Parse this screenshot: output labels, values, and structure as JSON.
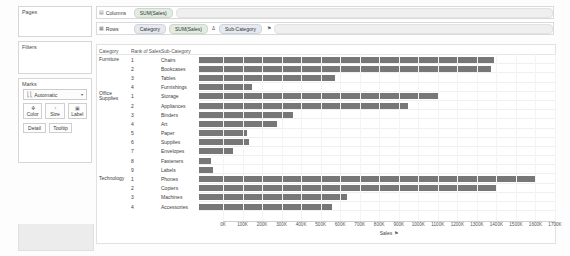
{
  "left_panel": {
    "pages": {
      "title": "Pages"
    },
    "filters": {
      "title": "Filters"
    },
    "marks": {
      "title": "Marks",
      "type_icon": "bar-chart-icon",
      "type_label": "Automatic",
      "caret": "▾",
      "buttons": [
        {
          "name": "color",
          "label": "Color",
          "icon": "❖"
        },
        {
          "name": "size",
          "label": "Size",
          "icon": "◔"
        },
        {
          "name": "label",
          "label": "Label",
          "icon": "▣"
        },
        {
          "name": "detail",
          "label": "Detail",
          "icon": ""
        },
        {
          "name": "tooltip",
          "label": "Tooltip",
          "icon": ""
        }
      ]
    }
  },
  "shelves": {
    "columns": {
      "icon": "⦀",
      "label": "Columns",
      "pills": [
        {
          "text": "SUM(Sales)",
          "type": "green"
        }
      ]
    },
    "rows": {
      "icon": "≡",
      "label": "Rows",
      "pills": [
        {
          "text": "Category",
          "type": "blue"
        },
        {
          "text": "SUM(Sales)",
          "type": "green"
        },
        {
          "text": "Δ",
          "type": "sym"
        },
        {
          "text": "Sub-Category",
          "type": "blue",
          "sort_icon": "⚑"
        }
      ]
    }
  },
  "viz": {
    "headers": {
      "category": "Category",
      "rank": "Rank of Sales",
      "subcategory": "Sub-Category"
    },
    "axis_title": "Sales",
    "axis_sort_icon": "⚑"
  },
  "chart_data": {
    "type": "bar",
    "title": "",
    "xlabel": "Sales",
    "ylabel": "",
    "xlim": [
      0,
      1700000
    ],
    "grid": true,
    "legend": "none",
    "orientation": "horizontal",
    "bar_color": "#777777",
    "tick_labels": [
      "0K",
      "100K",
      "200K",
      "300K",
      "400K",
      "500K",
      "600K",
      "700K",
      "800K",
      "900K",
      "1000K",
      "1100K",
      "1200K",
      "1300K",
      "1400K",
      "1500K",
      "1600K",
      "1700K"
    ],
    "tick_values": [
      0,
      100000,
      200000,
      300000,
      400000,
      500000,
      600000,
      700000,
      800000,
      900000,
      1000000,
      1100000,
      1200000,
      1300000,
      1400000,
      1500000,
      1600000,
      1700000
    ],
    "rows": [
      {
        "category": "Furniture",
        "category_line2": "",
        "rank": "1",
        "subcategory": "Chairs",
        "value": 1407000
      },
      {
        "category": "",
        "category_line2": "",
        "rank": "2",
        "subcategory": "Bookcases",
        "value": 1392000
      },
      {
        "category": "",
        "category_line2": "",
        "rank": "3",
        "subcategory": "Tables",
        "value": 650000
      },
      {
        "category": "",
        "category_line2": "",
        "rank": "4",
        "subcategory": "Furnishings",
        "value": 253000
      },
      {
        "category": "Office",
        "category_line2": "Supplies",
        "rank": "1",
        "subcategory": "Storage",
        "value": 1140000
      },
      {
        "category": "",
        "category_line2": "",
        "rank": "2",
        "subcategory": "Appliances",
        "value": 1000000
      },
      {
        "category": "",
        "category_line2": "",
        "rank": "3",
        "subcategory": "Binders",
        "value": 447000
      },
      {
        "category": "",
        "category_line2": "",
        "rank": "4",
        "subcategory": "Art",
        "value": 372000
      },
      {
        "category": "",
        "category_line2": "",
        "rank": "5",
        "subcategory": "Paper",
        "value": 228000
      },
      {
        "category": "",
        "category_line2": "",
        "rank": "6",
        "subcategory": "Supplies",
        "value": 238000
      },
      {
        "category": "",
        "category_line2": "",
        "rank": "7",
        "subcategory": "Envelopes",
        "value": 163000
      },
      {
        "category": "",
        "category_line2": "",
        "rank": "8",
        "subcategory": "Fasteners",
        "value": 55000
      },
      {
        "category": "",
        "category_line2": "",
        "rank": "9",
        "subcategory": "Labels",
        "value": 66000
      },
      {
        "category": "Technology",
        "category_line2": "",
        "rank": "1",
        "subcategory": "Phones",
        "value": 1607000
      },
      {
        "category": "",
        "category_line2": "",
        "rank": "2",
        "subcategory": "Copiers",
        "value": 1422000
      },
      {
        "category": "",
        "category_line2": "",
        "rank": "3",
        "subcategory": "Machines",
        "value": 708000
      },
      {
        "category": "",
        "category_line2": "",
        "rank": "4",
        "subcategory": "Accessories",
        "value": 637000
      }
    ]
  }
}
